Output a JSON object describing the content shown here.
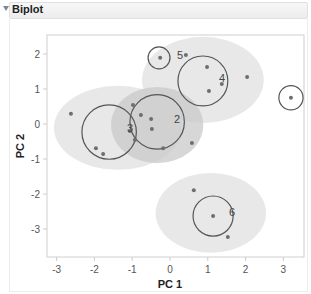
{
  "header": {
    "title": "Biplot",
    "collapse_icon": "disclosure-triangle-down"
  },
  "chart_data": {
    "type": "scatter",
    "title": "Biplot",
    "xlabel": "PC 1",
    "ylabel": "PC 2",
    "xlim": [
      -3.3,
      3.5
    ],
    "ylim": [
      -3.8,
      2.6
    ],
    "xticks": [
      "-3",
      "-2",
      "-1",
      "0",
      "1",
      "2",
      "3"
    ],
    "yticks": [
      "2",
      "1",
      "0",
      "-1",
      "-2",
      "-3"
    ],
    "grid": false,
    "legend": "none",
    "clusters": [
      {
        "id": "1",
        "label": "",
        "center": [
          3.2,
          0.75
        ],
        "circle_radius": 0.32,
        "ellipse": null,
        "points": [
          [
            3.2,
            0.75
          ]
        ]
      },
      {
        "id": "2",
        "label": "2",
        "center": [
          -0.34,
          0.06
        ],
        "circle_radius": 0.72,
        "ellipse": {
          "cx": -0.34,
          "cy": -0.03,
          "rx": 1.22,
          "ry": 1.09,
          "shade": "dark"
        },
        "points": [
          [
            -0.77,
            0.26
          ],
          [
            -0.5,
            0.14
          ],
          [
            -0.48,
            -0.14
          ],
          [
            -0.18,
            -0.69
          ],
          [
            0.58,
            -0.54
          ],
          [
            -0.98,
            0.54
          ]
        ]
      },
      {
        "id": "3",
        "label": "3",
        "center": [
          -1.61,
          -0.23
        ],
        "circle_radius": 0.72,
        "ellipse": {
          "cx": -1.38,
          "cy": -0.11,
          "rx": 1.69,
          "ry": 1.2,
          "shade": "light"
        },
        "points": [
          [
            -2.62,
            0.29
          ],
          [
            -1.96,
            -0.69
          ],
          [
            -1.77,
            -0.86
          ],
          [
            -1.06,
            -0.2
          ],
          [
            -0.93,
            -0.46
          ]
        ]
      },
      {
        "id": "4",
        "label": "4",
        "center": [
          0.87,
          1.23
        ],
        "circle_radius": 0.66,
        "ellipse": {
          "cx": 0.87,
          "cy": 1.26,
          "rx": 1.61,
          "ry": 1.23,
          "shade": "light"
        },
        "points": [
          [
            0.98,
            1.63
          ],
          [
            1.03,
            0.94
          ],
          [
            1.37,
            1.14
          ],
          [
            2.04,
            1.34
          ],
          [
            0.42,
            1.97
          ]
        ]
      },
      {
        "id": "5",
        "label": "5",
        "center": [
          -0.29,
          1.89
        ],
        "circle_radius": 0.29,
        "ellipse": null,
        "points": [
          [
            -0.26,
            1.89
          ]
        ]
      },
      {
        "id": "6",
        "label": "6",
        "center": [
          1.14,
          -2.63
        ],
        "circle_radius": 0.53,
        "ellipse": {
          "cx": 1.08,
          "cy": -2.54,
          "rx": 1.46,
          "ry": 1.14,
          "shade": "light"
        },
        "points": [
          [
            0.63,
            -1.89
          ],
          [
            1.14,
            -2.63
          ],
          [
            1.53,
            -3.23
          ]
        ]
      }
    ]
  },
  "colors": {
    "ellipse_light": "#e4e4e4",
    "ellipse_dark": "#c9c9c9",
    "circle_stroke": "#555555",
    "point": "#6e6e6e",
    "axis": "#cccccc"
  }
}
